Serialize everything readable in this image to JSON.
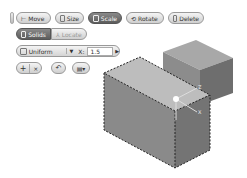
{
  "toolbar": {
    "move": "Move",
    "size": "Size",
    "scale": "Scale",
    "rotate": "Rotate",
    "delete": "Delete"
  },
  "mode": {
    "solids": "Solids",
    "locate": "Locate"
  },
  "scale_options": {
    "type": "Uniform",
    "axis_label": "X:",
    "value": "1.5"
  },
  "actions": {
    "add": "+",
    "remove": "×",
    "undo_icon": "undo-arrow",
    "view_icon": "view-dropdown"
  },
  "viewport": {
    "selected_object": "box-dashed-selection",
    "second_object": "box"
  }
}
